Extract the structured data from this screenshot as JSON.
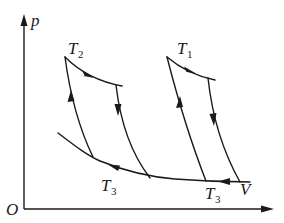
{
  "diagram": {
    "type": "p-V thermodynamic cycle diagram",
    "axes": {
      "origin_label": "O",
      "y_label": "p",
      "x_label": "V"
    },
    "isotherm_labels": {
      "T1": {
        "main": "T",
        "sub": "1"
      },
      "T2": {
        "main": "T",
        "sub": "2"
      },
      "T3_left": {
        "main": "T",
        "sub": "3"
      },
      "T3_right": {
        "main": "T",
        "sub": "3"
      }
    },
    "cycles": [
      {
        "name": "left-cycle",
        "hot_isotherm": "T2",
        "cold_isotherm": "T3",
        "direction": "clockwise"
      },
      {
        "name": "right-cycle",
        "hot_isotherm": "T1",
        "cold_isotherm": "T3",
        "direction": "clockwise"
      }
    ],
    "colors": {
      "ink": "#1a1a1a",
      "background": "#ffffff"
    }
  }
}
